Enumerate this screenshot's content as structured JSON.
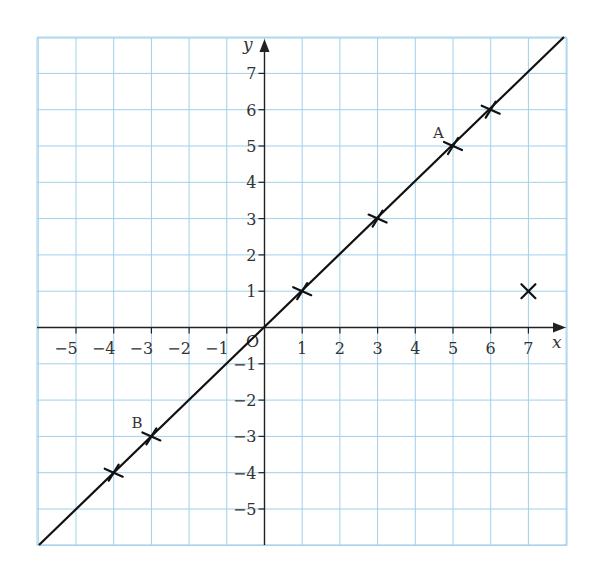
{
  "chart_data": {
    "type": "line",
    "title": "",
    "xlabel": "x",
    "ylabel": "y",
    "origin_label": "O",
    "xlim": [
      -6,
      8
    ],
    "ylim": [
      -6,
      8
    ],
    "grid": true,
    "x_ticks": [
      -5,
      -4,
      -3,
      -2,
      -1,
      1,
      2,
      3,
      4,
      5,
      6,
      7
    ],
    "x_tick_labels": [
      "−5",
      "−4",
      "−3",
      "−2",
      "−1",
      "1",
      "2",
      "3",
      "4",
      "5",
      "6",
      "7"
    ],
    "y_ticks": [
      7,
      6,
      5,
      4,
      3,
      2,
      1,
      -1,
      -2,
      -3,
      -4,
      -5
    ],
    "y_tick_labels": [
      "7",
      "6",
      "5",
      "4",
      "3",
      "2",
      "1",
      "−1",
      "−2",
      "−3",
      "−4",
      "−5"
    ],
    "series": [
      {
        "name": "y = x",
        "kind": "line",
        "x": [
          -6,
          8
        ],
        "y": [
          -6,
          8
        ]
      },
      {
        "name": "plotted points",
        "kind": "scatter",
        "marker": "x",
        "points": [
          {
            "x": -4,
            "y": -4,
            "label": ""
          },
          {
            "x": -3,
            "y": -3,
            "label": "B"
          },
          {
            "x": 1,
            "y": 1,
            "label": ""
          },
          {
            "x": 3,
            "y": 3,
            "label": ""
          },
          {
            "x": 5,
            "y": 5,
            "label": "A"
          },
          {
            "x": 6,
            "y": 6,
            "label": ""
          },
          {
            "x": 7,
            "y": 1,
            "label": ""
          }
        ]
      }
    ],
    "annotations": [
      {
        "text": "A",
        "x": 5,
        "y": 5
      },
      {
        "text": "B",
        "x": -3,
        "y": -3
      }
    ]
  },
  "colors": {
    "grid": "#9fd0ea",
    "axis": "#222222",
    "line": "#111111"
  }
}
